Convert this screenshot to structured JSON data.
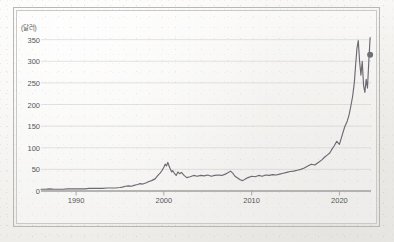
{
  "figure": {
    "unit_label": "(달러)",
    "background_color": "#f4f3f1",
    "line_color": "#6a6a72",
    "grid_color": "#d2d0cd",
    "axis_color": "#8f8d8a",
    "text_color": "#585654"
  },
  "chart_data": {
    "type": "line",
    "title": "",
    "subtitle": "",
    "xlabel": "",
    "ylabel": "(달러)",
    "unit": "달러",
    "grid": true,
    "legend": false,
    "legend_position": "none",
    "xlim": [
      1986,
      2023.6
    ],
    "ylim": [
      0,
      370
    ],
    "xticks": [
      1990,
      2000,
      2010,
      2020
    ],
    "xtick_labels": [
      "1990",
      "2000",
      "2010",
      "2020"
    ],
    "yticks": [
      0,
      50,
      100,
      150,
      200,
      250,
      300,
      350
    ],
    "ytick_labels": [
      "0",
      "50",
      "100",
      "150",
      "200",
      "250",
      "300",
      "350"
    ],
    "end_marker": {
      "x": 2023.5,
      "y": 315,
      "shape": "circle"
    },
    "series": [
      {
        "name": "price",
        "x": [
          1986.0,
          1986.5,
          1987.0,
          1987.5,
          1988.0,
          1988.5,
          1989.0,
          1989.5,
          1990.0,
          1990.5,
          1991.0,
          1991.5,
          1992.0,
          1992.5,
          1993.0,
          1993.5,
          1994.0,
          1994.5,
          1995.0,
          1995.3,
          1995.6,
          1996.0,
          1996.3,
          1996.6,
          1997.0,
          1997.3,
          1997.6,
          1998.0,
          1998.3,
          1998.6,
          1999.0,
          1999.2,
          1999.4,
          1999.6,
          1999.8,
          2000.0,
          2000.15,
          2000.3,
          2000.45,
          2000.6,
          2000.75,
          2000.9,
          2001.0,
          2001.2,
          2001.4,
          2001.6,
          2001.8,
          2002.0,
          2002.3,
          2002.6,
          2003.0,
          2003.4,
          2003.8,
          2004.2,
          2004.6,
          2005.0,
          2005.4,
          2005.8,
          2006.2,
          2006.6,
          2007.0,
          2007.3,
          2007.6,
          2007.9,
          2008.1,
          2008.4,
          2008.7,
          2009.0,
          2009.3,
          2009.6,
          2010.0,
          2010.4,
          2010.8,
          2011.2,
          2011.6,
          2012.0,
          2012.4,
          2012.8,
          2013.2,
          2013.6,
          2014.0,
          2014.4,
          2014.8,
          2015.2,
          2015.6,
          2016.0,
          2016.4,
          2016.8,
          2017.2,
          2017.6,
          2018.0,
          2018.3,
          2018.6,
          2018.9,
          2019.1,
          2019.4,
          2019.7,
          2020.0,
          2020.3,
          2020.6,
          2020.9,
          2021.1,
          2021.3,
          2021.5,
          2021.7,
          2021.85,
          2022.0,
          2022.15,
          2022.3,
          2022.45,
          2022.6,
          2022.75,
          2022.9,
          2023.05,
          2023.2,
          2023.35,
          2023.5
        ],
        "y": [
          4,
          4,
          5,
          4,
          4,
          4,
          5,
          5,
          5,
          5,
          5,
          6,
          6,
          6,
          6,
          7,
          7,
          7,
          8,
          9,
          11,
          12,
          11,
          13,
          15,
          17,
          16,
          19,
          22,
          24,
          28,
          33,
          38,
          42,
          48,
          55,
          62,
          58,
          66,
          57,
          50,
          44,
          47,
          41,
          36,
          44,
          40,
          43,
          36,
          31,
          33,
          36,
          34,
          36,
          35,
          37,
          34,
          36,
          37,
          36,
          39,
          42,
          46,
          40,
          34,
          30,
          26,
          24,
          28,
          31,
          34,
          33,
          36,
          34,
          37,
          36,
          38,
          37,
          39,
          41,
          43,
          45,
          46,
          48,
          50,
          53,
          58,
          62,
          60,
          66,
          72,
          78,
          83,
          88,
          95,
          104,
          115,
          108,
          128,
          148,
          162,
          176,
          196,
          218,
          250,
          292,
          330,
          348,
          300,
          268,
          300,
          245,
          228,
          258,
          238,
          300,
          355
        ]
      }
    ]
  }
}
